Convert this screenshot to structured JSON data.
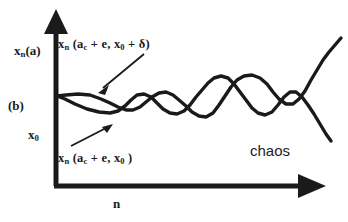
{
  "figure": {
    "background_color": "#ffffff",
    "ink_color": "#1a1a1a",
    "panel_label": "(b)",
    "caption_note": "chaos"
  },
  "axes": {
    "y_label_prefix": "x",
    "y_label_sub": "n",
    "y_label_suffix": "(a)",
    "y_label_full": "x_n(a)",
    "y_origin_label_prefix": "x",
    "y_origin_label_sub": "0",
    "x_label": "n",
    "x_axis_arrow": "arrow-right",
    "y_axis_arrow": "arrow-up"
  },
  "annotations": {
    "upper": {
      "text_prefix": "x",
      "text_sub": "n",
      "text_body": " (a",
      "text_sub2": "c",
      "text_body2": " + e, x",
      "text_sub3": "0",
      "text_body3": " + δ)",
      "full": "x_n (a_c + e, x_0 + δ)",
      "pointer": "arrow-down-left"
    },
    "lower": {
      "text_prefix": "x",
      "text_sub": "n",
      "text_body": " (a",
      "text_sub2": "c",
      "text_body2": " + e, x",
      "text_sub3": "0",
      "text_body3": " )",
      "full": "x_n (a_c + e, x_0)",
      "pointer": "arrow-up-right"
    },
    "chaos_label": "chaos"
  },
  "chart_data": {
    "type": "line",
    "title": "",
    "subtitle": "",
    "xlabel": "n",
    "ylabel": "x_n(a)",
    "xlim": [
      0,
      100
    ],
    "ylim": [
      0,
      100
    ],
    "grid": false,
    "legend": "none",
    "annotation_texts": [
      "x_n (a_c + e, x_0 + δ)",
      "x_n (a_c + e, x_0)",
      "chaos",
      "(b)",
      "x_0",
      "x_n(a)",
      "n"
    ],
    "series": [
      {
        "name": "x_n (a_c + e, x_0 + δ)",
        "color": "#1a1a1a",
        "points": [
          [
            57,
            96
          ],
          [
            66,
            95
          ],
          [
            78,
            94
          ],
          [
            90,
            95
          ],
          [
            101,
            99
          ],
          [
            110,
            103
          ],
          [
            118,
            107
          ],
          [
            126,
            110
          ],
          [
            133,
            110
          ],
          [
            140,
            107
          ],
          [
            146,
            102
          ],
          [
            152,
            97
          ],
          [
            159,
            93
          ],
          [
            166,
            92
          ],
          [
            173,
            95
          ],
          [
            179,
            100
          ],
          [
            186,
            106
          ],
          [
            192,
            112
          ],
          [
            199,
            116
          ],
          [
            206,
            117
          ],
          [
            213,
            113
          ],
          [
            219,
            105
          ],
          [
            225,
            96
          ],
          [
            231,
            87
          ],
          [
            237,
            80
          ],
          [
            244,
            76
          ],
          [
            252,
            75
          ],
          [
            260,
            78
          ],
          [
            267,
            84
          ],
          [
            273,
            92
          ],
          [
            279,
            99
          ],
          [
            286,
            104
          ],
          [
            293,
            104
          ],
          [
            299,
            99
          ],
          [
            305,
            91
          ],
          [
            311,
            80
          ],
          [
            317,
            70
          ],
          [
            323,
            60
          ],
          [
            329,
            52
          ],
          [
            335,
            45
          ],
          [
            341,
            38
          ]
        ]
      },
      {
        "name": "x_n (a_c + e, x_0)",
        "color": "#1a1a1a",
        "points": [
          [
            57,
            96
          ],
          [
            65,
            99
          ],
          [
            75,
            104
          ],
          [
            87,
            109
          ],
          [
            99,
            112
          ],
          [
            110,
            113
          ],
          [
            118,
            111
          ],
          [
            125,
            106
          ],
          [
            131,
            100
          ],
          [
            137,
            95
          ],
          [
            144,
            94
          ],
          [
            151,
            97
          ],
          [
            157,
            103
          ],
          [
            163,
            109
          ],
          [
            170,
            113
          ],
          [
            177,
            114
          ],
          [
            184,
            111
          ],
          [
            190,
            105
          ],
          [
            196,
            97
          ],
          [
            202,
            90
          ],
          [
            208,
            83
          ],
          [
            214,
            78
          ],
          [
            221,
            76
          ],
          [
            228,
            78
          ],
          [
            234,
            84
          ],
          [
            240,
            92
          ],
          [
            246,
            100
          ],
          [
            252,
            108
          ],
          [
            258,
            113
          ],
          [
            265,
            115
          ],
          [
            272,
            112
          ],
          [
            278,
            105
          ],
          [
            284,
            97
          ],
          [
            290,
            92
          ],
          [
            296,
            92
          ],
          [
            302,
            97
          ],
          [
            308,
            105
          ],
          [
            314,
            114
          ],
          [
            320,
            124
          ],
          [
            326,
            134
          ],
          [
            331,
            141
          ]
        ]
      }
    ]
  }
}
